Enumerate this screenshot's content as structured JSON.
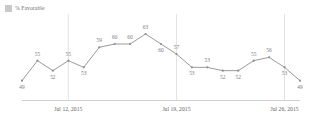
{
  "legend": {
    "label": "% Favorable",
    "swatch_color": "#c9c9c9",
    "position": "top-left"
  },
  "chart_data": {
    "type": "line",
    "title": "",
    "subtitle": "",
    "xlabel": "",
    "ylabel": "",
    "grid": "vertical-only",
    "legend_position": "top-left",
    "line_color": "#9a9a9a",
    "marker_color": "#8f8f8f",
    "label_color": "#7a7a7a",
    "gridline_color": "#e2e2e2",
    "axis_color": "#cfcfcf",
    "ylim": [
      45,
      66
    ],
    "series": [
      {
        "name": "% Favorable",
        "values": [
          49,
          55,
          52,
          55,
          53,
          59,
          60,
          60,
          63,
          60,
          57,
          53,
          53,
          52,
          52,
          55,
          56,
          53,
          49
        ]
      }
    ],
    "point_labels": [
      "49",
      "55",
      "52",
      "55",
      "53",
      "59",
      "60",
      "60",
      "63",
      "60",
      "57",
      "53",
      "53",
      "52",
      "52",
      "55",
      "56",
      "53",
      "49"
    ],
    "label_placement": [
      "below",
      "above",
      "below",
      "above",
      "below",
      "above",
      "above",
      "above",
      "above",
      "below",
      "above",
      "below",
      "above",
      "below",
      "below",
      "above",
      "above",
      "below",
      "below"
    ],
    "x_tick_labels": [
      "Jul 12, 2015",
      "Jul 19, 2015",
      "Jul 26, 2015"
    ],
    "x_tick_indices": [
      3,
      10,
      17
    ],
    "gridline_indices": [
      3,
      10,
      17
    ]
  }
}
